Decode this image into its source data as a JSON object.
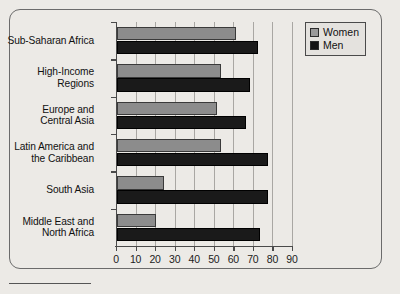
{
  "chart_data": {
    "type": "bar",
    "orientation": "horizontal",
    "title": "",
    "xlabel": "",
    "ylabel": "",
    "xlim": [
      0,
      90
    ],
    "xticks": [
      0,
      10,
      20,
      30,
      40,
      50,
      60,
      70,
      80,
      90
    ],
    "grid": true,
    "legend_position": "top-right",
    "categories": [
      "Sub-Saharan Africa",
      "High-Income Regions",
      "Europe and Central Asia",
      "Latin America and the Caribbean",
      "South Asia",
      "Middle East and North Africa"
    ],
    "category_labels": [
      [
        "Sub-Saharan Africa"
      ],
      [
        "High-Income",
        "Regions"
      ],
      [
        "Europe and",
        "Central Asia"
      ],
      [
        "Latin America and",
        "the Caribbean"
      ],
      [
        "South Asia"
      ],
      [
        "Middle East and",
        "North Africa"
      ]
    ],
    "series": [
      {
        "name": "Women",
        "color": "#8c8c8c",
        "values": [
          61,
          53,
          51,
          53,
          24,
          20
        ]
      },
      {
        "name": "Men",
        "color": "#1a1a1a",
        "values": [
          72,
          68,
          66,
          77,
          77,
          73
        ]
      }
    ]
  },
  "legend": {
    "items": [
      {
        "label": "Women",
        "swatch": "women-swatch"
      },
      {
        "label": "Men",
        "swatch": "men-swatch"
      }
    ]
  },
  "axis": {
    "tick_labels": [
      "0",
      "10",
      "20",
      "30",
      "40",
      "50",
      "60",
      "70",
      "80",
      "90"
    ]
  },
  "colors": {
    "background": "#eceae6",
    "frame": "#6b6b6b",
    "axis": "#4a4a4a",
    "grid": "#a9a7a3",
    "women": "#8c8c8c",
    "men": "#1a1a1a"
  }
}
